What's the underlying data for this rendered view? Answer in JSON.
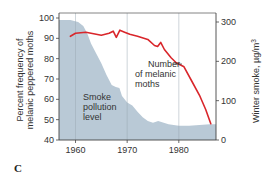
{
  "chart_data": {
    "type": "line",
    "panel_label": "C",
    "title": "",
    "xlabel": "",
    "x_ticks": [
      1960,
      1970,
      1980
    ],
    "xlim": [
      1956.8,
      1987.2
    ],
    "left_axis": {
      "label": "Percent frequency of melanic peppered moths",
      "label_line1": "Percent frequency of",
      "label_line2": "melanic peppered moths",
      "ticks": [
        40,
        50,
        60,
        70,
        80,
        90,
        100
      ],
      "ylim": [
        40,
        102
      ]
    },
    "right_axis": {
      "label": "Winter smoke, µg/m³",
      "label_text": "Winter smoke, µg/m",
      "label_sup": "3",
      "ticks": [
        0,
        100,
        200,
        300
      ],
      "ylim": [
        0,
        300
      ]
    },
    "grid": {
      "vertical_lines_at": [
        1960,
        1970,
        1980
      ],
      "horizontal": false
    },
    "series": [
      {
        "name": "Number of melanic moths",
        "axis": "left",
        "kind": "line",
        "color": "#d9262b",
        "x": [
          1959,
          1960,
          1962,
          1964,
          1965,
          1966.5,
          1967.3,
          1967.9,
          1968.6,
          1969.5,
          1970.5,
          1972,
          1974,
          1975.3,
          1975.9,
          1976.5,
          1977.2,
          1978.5,
          1979.5,
          1981,
          1982.5,
          1984,
          1985.2,
          1986.2
        ],
        "values": [
          91,
          92.5,
          93,
          92,
          91.5,
          92.5,
          93.5,
          90.5,
          94,
          93,
          92,
          91,
          89.5,
          86.5,
          86,
          88,
          84.5,
          80.5,
          78,
          76,
          69,
          62,
          55,
          48
        ]
      },
      {
        "name": "Smoke pollution level",
        "axis": "right",
        "kind": "area",
        "color": "#b9c9d6",
        "x": [
          1956.8,
          1959,
          1960.5,
          1961.5,
          1962.3,
          1963,
          1964,
          1965,
          1966,
          1967,
          1967.8,
          1968.5,
          1969,
          1970,
          1971,
          1972,
          1973,
          1974,
          1975,
          1976,
          1978,
          1980,
          1982,
          1984,
          1986,
          1987.2
        ],
        "values": [
          305,
          305,
          300,
          290,
          270,
          245,
          220,
          195,
          165,
          140,
          135,
          132,
          112,
          95,
          88,
          72,
          58,
          48,
          44,
          48,
          40,
          36,
          36,
          38,
          40,
          40
        ]
      }
    ],
    "annotations": [
      {
        "text_lines": [
          "Number",
          "of melanic",
          "moths"
        ],
        "target_series": "Number of melanic moths"
      },
      {
        "text_lines": [
          "Smoke",
          "pollution",
          "level"
        ],
        "target_series": "Smoke pollution level"
      }
    ]
  }
}
